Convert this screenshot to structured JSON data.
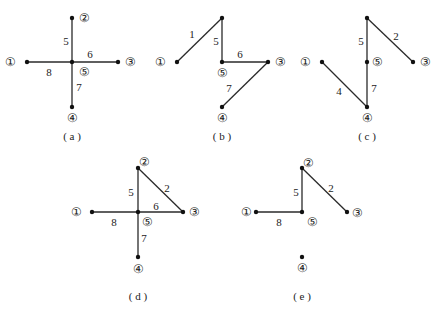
{
  "graphs": [
    {
      "id": "a",
      "caption": "( a )",
      "caption_pos": [
        72,
        136
      ],
      "nodes": [
        {
          "id": "1",
          "label": "①",
          "x": 27,
          "y": 62,
          "lx": 10,
          "ly": 62
        },
        {
          "id": "2",
          "label": "②",
          "x": 72,
          "y": 18,
          "lx": 84,
          "ly": 18
        },
        {
          "id": "3",
          "label": "③",
          "x": 118,
          "y": 62,
          "lx": 130,
          "ly": 62
        },
        {
          "id": "4",
          "label": "④",
          "x": 72,
          "y": 107,
          "lx": 72,
          "ly": 118
        },
        {
          "id": "5",
          "label": "⑤",
          "x": 72,
          "y": 62,
          "lx": 84,
          "ly": 72
        }
      ],
      "edges": [
        {
          "from": "2",
          "to": "5",
          "weight": "5",
          "wx": 66,
          "wy": 41
        },
        {
          "from": "1",
          "to": "5",
          "weight": "8",
          "wx": 49,
          "wy": 72
        },
        {
          "from": "5",
          "to": "3",
          "weight": "6",
          "wx": 90,
          "wy": 54
        },
        {
          "from": "5",
          "to": "4",
          "weight": "7",
          "wx": 79,
          "wy": 87
        }
      ]
    },
    {
      "id": "b",
      "caption": "( b )",
      "caption_pos": [
        222,
        136
      ],
      "nodes": [
        {
          "id": "1",
          "label": "①",
          "x": 177,
          "y": 62,
          "lx": 160,
          "ly": 62
        },
        {
          "id": "2",
          "label": "",
          "x": 222,
          "y": 18,
          "lx": 234,
          "ly": 18
        },
        {
          "id": "3",
          "label": "③",
          "x": 268,
          "y": 62,
          "lx": 280,
          "ly": 62
        },
        {
          "id": "4",
          "label": "④",
          "x": 222,
          "y": 107,
          "lx": 222,
          "ly": 118
        },
        {
          "id": "5",
          "label": "⑤",
          "x": 222,
          "y": 62,
          "lx": 222,
          "ly": 73
        }
      ],
      "edges": [
        {
          "from": "1",
          "to": "2",
          "weight": "1",
          "wx": 192,
          "wy": 34
        },
        {
          "from": "2",
          "to": "5",
          "weight": "5",
          "wx": 216,
          "wy": 41
        },
        {
          "from": "5",
          "to": "3",
          "weight": "6",
          "wx": 240,
          "wy": 54
        },
        {
          "from": "3",
          "to": "4",
          "weight": "7",
          "wx": 229,
          "wy": 88
        }
      ]
    },
    {
      "id": "c",
      "caption": "( c )",
      "caption_pos": [
        367,
        136
      ],
      "nodes": [
        {
          "id": "1",
          "label": "①",
          "x": 322,
          "y": 62,
          "lx": 305,
          "ly": 62
        },
        {
          "id": "2",
          "label": "",
          "x": 367,
          "y": 18,
          "lx": 379,
          "ly": 18
        },
        {
          "id": "3",
          "label": "③",
          "x": 413,
          "y": 62,
          "lx": 425,
          "ly": 62
        },
        {
          "id": "4",
          "label": "④",
          "x": 367,
          "y": 107,
          "lx": 367,
          "ly": 118
        },
        {
          "id": "5",
          "label": "⑤",
          "x": 367,
          "y": 62,
          "lx": 377,
          "ly": 62
        }
      ],
      "edges": [
        {
          "from": "2",
          "to": "5",
          "weight": "5",
          "wx": 361,
          "wy": 41
        },
        {
          "from": "2",
          "to": "3",
          "weight": "2",
          "wx": 396,
          "wy": 36
        },
        {
          "from": "1",
          "to": "4",
          "weight": "4",
          "wx": 339,
          "wy": 91
        },
        {
          "from": "5",
          "to": "4",
          "weight": "7",
          "wx": 374,
          "wy": 88
        }
      ]
    },
    {
      "id": "d",
      "caption": "( d )",
      "caption_pos": [
        138,
        296
      ],
      "nodes": [
        {
          "id": "1",
          "label": "①",
          "x": 92,
          "y": 212,
          "lx": 76,
          "ly": 212
        },
        {
          "id": "2",
          "label": "②",
          "x": 138,
          "y": 168,
          "lx": 144,
          "ly": 162
        },
        {
          "id": "3",
          "label": "③",
          "x": 183,
          "y": 212,
          "lx": 194,
          "ly": 212
        },
        {
          "id": "4",
          "label": "④",
          "x": 138,
          "y": 257,
          "lx": 138,
          "ly": 269
        },
        {
          "id": "5",
          "label": "⑤",
          "x": 138,
          "y": 212,
          "lx": 147,
          "ly": 222
        }
      ],
      "edges": [
        {
          "from": "2",
          "to": "5",
          "weight": "5",
          "wx": 131,
          "wy": 192
        },
        {
          "from": "2",
          "to": "3",
          "weight": "2",
          "wx": 167,
          "wy": 188
        },
        {
          "from": "1",
          "to": "5",
          "weight": "8",
          "wx": 114,
          "wy": 222
        },
        {
          "from": "5",
          "to": "3",
          "weight": "6",
          "wx": 156,
          "wy": 206
        },
        {
          "from": "5",
          "to": "4",
          "weight": "7",
          "wx": 144,
          "wy": 238
        }
      ]
    },
    {
      "id": "e",
      "caption": "( e )",
      "caption_pos": [
        302,
        296
      ],
      "nodes": [
        {
          "id": "1",
          "label": "①",
          "x": 256,
          "y": 212,
          "lx": 246,
          "ly": 212
        },
        {
          "id": "2",
          "label": "②",
          "x": 302,
          "y": 168,
          "lx": 308,
          "ly": 163
        },
        {
          "id": "3",
          "label": "③",
          "x": 347,
          "y": 212,
          "lx": 357,
          "ly": 213
        },
        {
          "id": "4",
          "label": "④",
          "x": 302,
          "y": 257,
          "lx": 302,
          "ly": 268
        },
        {
          "id": "5",
          "label": "⑤",
          "x": 302,
          "y": 212,
          "lx": 312,
          "ly": 222
        }
      ],
      "edges": [
        {
          "from": "2",
          "to": "5",
          "weight": "5",
          "wx": 296,
          "wy": 192
        },
        {
          "from": "2",
          "to": "3",
          "weight": "2",
          "wx": 331,
          "wy": 188
        },
        {
          "from": "1",
          "to": "5",
          "weight": "8",
          "wx": 279,
          "wy": 222
        }
      ]
    }
  ]
}
